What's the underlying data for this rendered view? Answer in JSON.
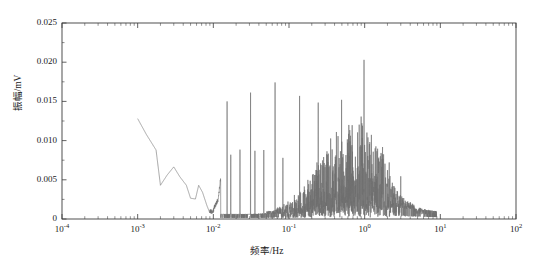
{
  "chart_data": {
    "type": "line",
    "title": "",
    "xlabel": "频率/Hz",
    "ylabel": "振幅/mV",
    "xscale": "log",
    "yscale": "linear",
    "xlim": [
      0.0001,
      100
    ],
    "ylim": [
      0,
      0.025
    ],
    "grid": false,
    "legend": null,
    "line_color": "#6e6e6e",
    "axis_color": "#3c3c3c",
    "xticks": [
      {
        "value": 0.0001,
        "label": "10",
        "exponent": "-4"
      },
      {
        "value": 0.001,
        "label": "10",
        "exponent": "-3"
      },
      {
        "value": 0.01,
        "label": "10",
        "exponent": "-2"
      },
      {
        "value": 0.1,
        "label": "10",
        "exponent": "-1"
      },
      {
        "value": 1,
        "label": "10",
        "exponent": "0"
      },
      {
        "value": 10,
        "label": "10",
        "exponent": "1"
      },
      {
        "value": 100,
        "label": "10",
        "exponent": "2"
      }
    ],
    "yticks": [
      {
        "value": 0,
        "label": "0"
      },
      {
        "value": 0.005,
        "label": "0.005"
      },
      {
        "value": 0.01,
        "label": "0.010"
      },
      {
        "value": 0.015,
        "label": "0.015"
      },
      {
        "value": 0.02,
        "label": "0.020"
      },
      {
        "value": 0.025,
        "label": "0.025"
      }
    ],
    "series": [
      {
        "name": "amplitude-spectrum",
        "description": "Frequency spectrum: decaying low-frequency trend, discrete harmonic spikes, broadband noise hump peaking near 1 Hz",
        "data_start_hz": 0.001,
        "data_end_hz": 9.0,
        "low_frequency_trend": [
          [
            0.001,
            0.0128
          ],
          [
            0.0013,
            0.0108
          ],
          [
            0.00175,
            0.0088
          ],
          [
            0.002,
            0.0043
          ],
          [
            0.00245,
            0.0056
          ],
          [
            0.003,
            0.00665
          ],
          [
            0.0036,
            0.0054
          ],
          [
            0.0044,
            0.0043
          ],
          [
            0.005,
            0.00265
          ],
          [
            0.0058,
            0.00255
          ],
          [
            0.0064,
            0.0043
          ],
          [
            0.0072,
            0.0034
          ],
          [
            0.0082,
            0.00175
          ],
          [
            0.009,
            0.00075
          ],
          [
            0.0098,
            0.0005
          ],
          [
            0.0105,
            0.0014
          ],
          [
            0.0115,
            0.0021
          ],
          [
            0.0125,
            0.0048
          ],
          [
            0.0135,
            0.003
          ],
          [
            0.0145,
            0.00195
          ]
        ],
        "major_spikes": [
          {
            "freq": 0.0152,
            "amplitude": 0.015
          },
          {
            "freq": 0.017,
            "amplitude": 0.0082
          },
          {
            "freq": 0.0225,
            "amplitude": 0.00885
          },
          {
            "freq": 0.031,
            "amplitude": 0.01612
          },
          {
            "freq": 0.0355,
            "amplitude": 0.0087
          },
          {
            "freq": 0.0465,
            "amplitude": 0.0088
          },
          {
            "freq": 0.0655,
            "amplitude": 0.01742
          },
          {
            "freq": 0.083,
            "amplitude": 0.0078
          },
          {
            "freq": 0.138,
            "amplitude": 0.0157
          },
          {
            "freq": 0.243,
            "amplitude": 0.01485
          },
          {
            "freq": 0.495,
            "amplitude": 0.0152
          },
          {
            "freq": 0.64,
            "amplitude": 0.0099
          },
          {
            "freq": 0.98,
            "amplitude": 0.0203
          },
          {
            "freq": 0.93,
            "amplitude": 0.01035
          },
          {
            "freq": 3.0,
            "amplitude": 0.00545
          }
        ],
        "noise_band": {
          "start_hz": 0.012,
          "end_hz": 9.0,
          "hump_center_hz": 0.72,
          "hump_peak_amplitude": 0.0079,
          "baseline_amplitude": 0.0006,
          "tail_amplitude": 0.0012
        },
        "max_amplitude": 0.0203,
        "max_amplitude_freq": 0.98
      }
    ]
  }
}
